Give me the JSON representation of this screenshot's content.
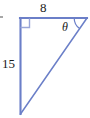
{
  "figure": {
    "type": "right-triangle-diagram",
    "background_color": "#ffffff",
    "stroke_color": "#6B7FC8",
    "label_color": "#1a1a1a",
    "labels": {
      "top_leg": "8",
      "left_leg": "15",
      "angle": "θ"
    },
    "geometry": {
      "right_angle_vertex": [
        20,
        18
      ],
      "top_right_vertex": [
        87,
        18
      ],
      "bottom_vertex": [
        20,
        114
      ],
      "top_leg_length_label": "8",
      "left_leg_length_label": "15",
      "right_angle_marker_size": 9,
      "angle_arc_radius": 13
    }
  }
}
